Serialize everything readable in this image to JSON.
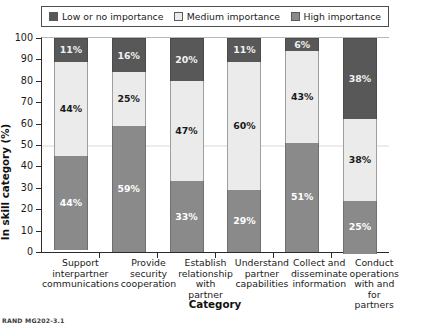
{
  "legend": {
    "items": [
      {
        "label": "Low or no importance",
        "color": "#585858",
        "key": "low"
      },
      {
        "label": "Medium importance",
        "color": "#ebebeb",
        "key": "medium"
      },
      {
        "label": "High importance",
        "color": "#8a8a8a",
        "key": "high"
      }
    ]
  },
  "axes": {
    "ylabel": "In skill category (%)",
    "xlabel": "Category",
    "yticks": [
      "0",
      "10",
      "20",
      "30",
      "40",
      "50",
      "60",
      "70",
      "80",
      "90",
      "100"
    ]
  },
  "footnote": "RAND MG202-3.1",
  "chart_data": {
    "type": "bar",
    "title": "",
    "subtitle": "",
    "xlabel": "Category",
    "ylabel": "In skill category (%)",
    "ylim": [
      0,
      100
    ],
    "yticks": [
      0,
      10,
      20,
      30,
      40,
      50,
      60,
      70,
      80,
      90,
      100
    ],
    "grid": false,
    "gridlines_at": [
      50
    ],
    "stacked": true,
    "stack_order_top_to_bottom": [
      "Low or no importance",
      "Medium importance",
      "High importance"
    ],
    "legend_position": "top",
    "categories": [
      "Support interpartner communications",
      "Provide security cooperation",
      "Establish relationship with partner",
      "Understand partner capabilities",
      "Collect and disseminate information",
      "Conduct operations with and for partners"
    ],
    "category_lines": [
      [
        "Support",
        "interpartner",
        "communications"
      ],
      [
        "Provide",
        "security",
        "cooperation"
      ],
      [
        "Establish",
        "relationship",
        "with partner"
      ],
      [
        "Understand",
        "partner",
        "capabilities"
      ],
      [
        "Collect and",
        "disseminate",
        "information"
      ],
      [
        "Conduct",
        "operations",
        "with and for",
        "partners"
      ]
    ],
    "series": [
      {
        "name": "Low or no importance",
        "color": "#585858",
        "values": [
          11,
          16,
          20,
          11,
          6,
          38
        ],
        "labels": [
          "11%",
          "16%",
          "20%",
          "11%",
          "6%",
          "38%"
        ]
      },
      {
        "name": "Medium importance",
        "color": "#ebebeb",
        "values": [
          44,
          25,
          47,
          60,
          43,
          38
        ],
        "labels": [
          "44%",
          "25%",
          "47%",
          "60%",
          "43%",
          "38%"
        ]
      },
      {
        "name": "High importance",
        "color": "#8a8a8a",
        "values": [
          44,
          59,
          33,
          29,
          51,
          25
        ],
        "labels": [
          "44%",
          "59%",
          "33%",
          "29%",
          "51%",
          "25%"
        ]
      }
    ]
  }
}
